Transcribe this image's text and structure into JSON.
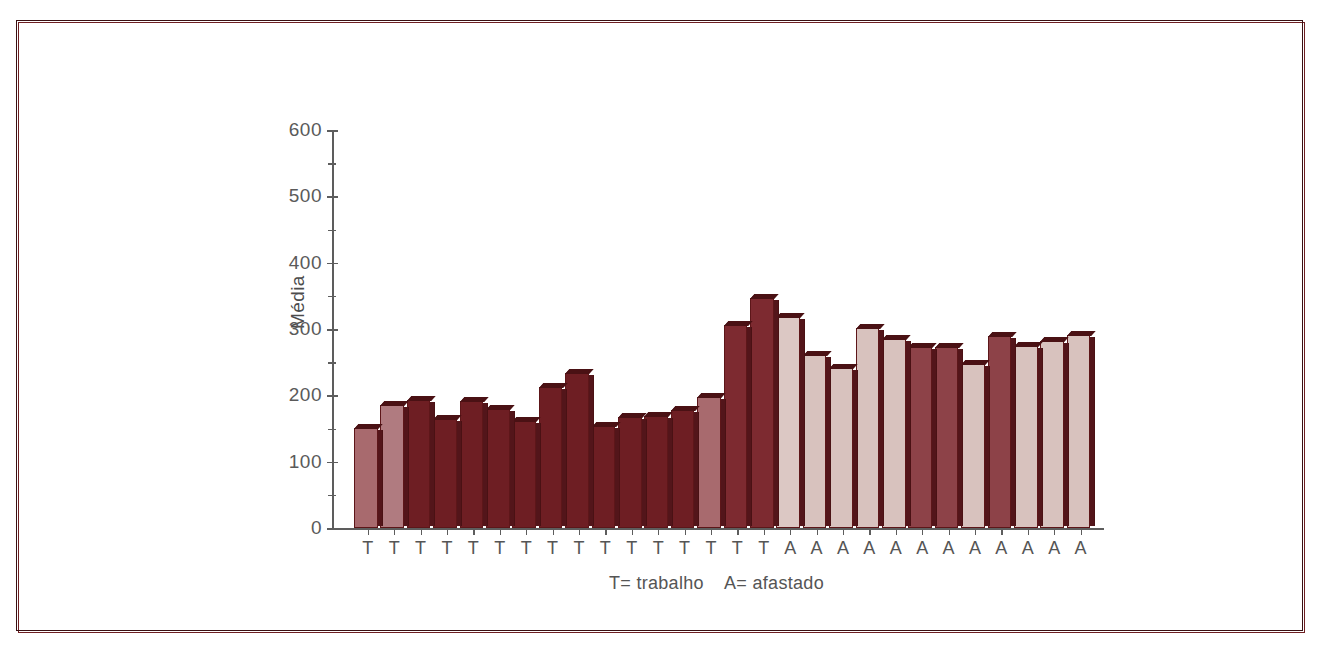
{
  "figure": {
    "frame_color": "#6e1f22",
    "background": "#ffffff"
  },
  "caption": "T= trabalho    A= afastado",
  "legend_note": {
    "t_meaning": "T= trabalho",
    "a_meaning": "A= afastado"
  },
  "chart_data": {
    "type": "bar",
    "title": "",
    "xlabel": "",
    "ylabel": "Média",
    "ylim": [
      0,
      600
    ],
    "ytick_labels": [
      "0",
      "100",
      "200",
      "300",
      "400",
      "500",
      "600"
    ],
    "ytick_values": [
      0,
      100,
      200,
      300,
      400,
      500,
      600
    ],
    "yminor_values": [
      50,
      150,
      250,
      350,
      450,
      550
    ],
    "grid": false,
    "legend_position": "none",
    "categories": [
      "T",
      "T",
      "T",
      "T",
      "T",
      "T",
      "T",
      "T",
      "T",
      "T",
      "T",
      "T",
      "T",
      "T",
      "T",
      "T",
      "A",
      "A",
      "A",
      "A",
      "A",
      "A",
      "A",
      "A",
      "A",
      "A",
      "A",
      "A"
    ],
    "values": [
      150,
      184,
      191,
      161,
      188,
      176,
      157,
      208,
      229,
      148,
      162,
      163,
      171,
      190,
      298,
      339,
      310,
      251,
      231,
      292,
      275,
      262,
      262,
      236,
      277,
      262,
      269,
      277
    ],
    "bar_fills": [
      "#a86a6e",
      "#b07b80",
      "#6e1e23",
      "#6e1e23",
      "#6e1e23",
      "#6e1e23",
      "#6e1e23",
      "#6e1e23",
      "#6e1e23",
      "#6e1e23",
      "#6e1e23",
      "#6e1e23",
      "#6e1e23",
      "#a86a6e",
      "#7d2a30",
      "#7d2a30",
      "#dcc8c4",
      "#d8c2be",
      "#d8c2be",
      "#d8c2be",
      "#d8c2be",
      "#8d4248",
      "#8d4248",
      "#d8c2be",
      "#8d4248",
      "#d8c2be",
      "#d8c2be",
      "#d8c2be"
    ]
  }
}
